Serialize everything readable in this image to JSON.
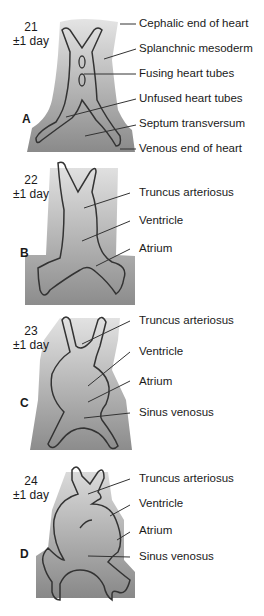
{
  "figure": {
    "panels": [
      {
        "letter": "A",
        "age_day": "21",
        "age_range": "±1 day",
        "labels": [
          "Cephalic end of heart",
          "Splanchnic mesoderm",
          "Fusing heart tubes",
          "Unfused heart tubes",
          "Septum transversum",
          "Venous end of heart"
        ]
      },
      {
        "letter": "B",
        "age_day": "22",
        "age_range": "±1 day",
        "labels": [
          "Truncus arteriosus",
          "Ventricle",
          "Atrium"
        ]
      },
      {
        "letter": "C",
        "age_day": "23",
        "age_range": "±1 day",
        "labels": [
          "Truncus arteriosus",
          "Ventricle",
          "Atrium",
          "Sinus venosus"
        ]
      },
      {
        "letter": "D",
        "age_day": "24",
        "age_range": "±1 day",
        "labels": [
          "Truncus arteriosus",
          "Ventricle",
          "Atrium",
          "Sinus venosus"
        ]
      }
    ],
    "colors": {
      "mesoderm_light": "#d9d9d9",
      "mesoderm_dark": "#8f8f8f",
      "outline": "#333333",
      "text": "#1a1a1a"
    }
  }
}
